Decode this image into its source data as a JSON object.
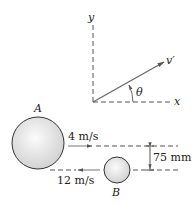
{
  "axes": {
    "x_label": "x",
    "y_label": "y",
    "velocity_label": "v′",
    "angle_label": "θ"
  },
  "spheres": {
    "a": {
      "label": "A",
      "speed": "4 m/s"
    },
    "b": {
      "label": "B",
      "speed": "12 m/s"
    }
  },
  "offset": {
    "label": "75 mm"
  },
  "colors": {
    "line": "#555555",
    "sphere_fill": "#e4e4e4",
    "sphere_edge": "#333333"
  }
}
